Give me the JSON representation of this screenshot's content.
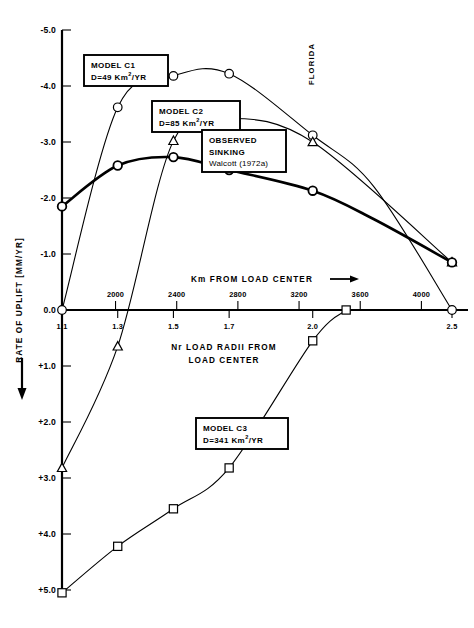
{
  "figure": {
    "florida_label": "FLORIDA",
    "y_axis": {
      "title_prefix_arrow": "↓",
      "title": "RATE OF UPLIFT  [MM/YR]",
      "ticks": [
        "-5.0",
        "-4.0",
        "-3.0",
        "-2.0",
        "-1.0",
        "0.0",
        "+1.0",
        "+2.0",
        "+3.0",
        "+4.0",
        "+5.0"
      ],
      "tick_values": [
        -5.0,
        -4.0,
        -3.0,
        -2.0,
        -1.0,
        0.0,
        1.0,
        2.0,
        3.0,
        4.0,
        5.0
      ]
    },
    "x_axis": {
      "top_title": "Km  FROM  LOAD  CENTER",
      "top_title_arrow": "⟶",
      "bottom_title_line1": "Nr  LOAD  RADII  FROM",
      "bottom_title_line2": "LOAD  CENTER",
      "km_ticks": [
        "2000",
        "2400",
        "2800",
        "3200",
        "3600",
        "4000"
      ],
      "km_tick_values": [
        2000,
        2400,
        2800,
        3200,
        3600,
        4000
      ],
      "nr_ticks": [
        "1.1",
        "1.3",
        "1.5",
        "1.7",
        "2.0",
        "2.5"
      ],
      "nr_tick_values": [
        1.1,
        1.3,
        1.5,
        1.7,
        2.0,
        2.5
      ]
    },
    "annotations": [
      {
        "id": "c1",
        "line1": "MODEL  C1",
        "line2_pre": "D=49  Km",
        "line2_sup": "2",
        "line2_post": "/YR"
      },
      {
        "id": "c2",
        "line1": "MODEL  C2",
        "line2_pre": "D=85  Km",
        "line2_sup": "2",
        "line2_post": "/YR"
      },
      {
        "id": "observed",
        "line1": "OBSERVED",
        "line2": "SINKING",
        "line3": "Walcott  (1972a)"
      },
      {
        "id": "c3",
        "line1": "MODEL  C3",
        "line2_pre": "D=341  Km",
        "line2_sup": "2",
        "line2_post": "/YR"
      }
    ]
  },
  "chart_data": {
    "type": "line",
    "title": "",
    "xlabel": "Nr LOAD RADII FROM LOAD CENTER",
    "ylabel": "RATE OF UPLIFT [MM/YR]",
    "xlim": [
      1.1,
      2.5
    ],
    "ylim": [
      5.0,
      -5.0
    ],
    "y_axis_inverted": true,
    "grid": false,
    "legend": "inline-annotation-boxes",
    "x_secondary_axis": {
      "label": "Km FROM LOAD CENTER",
      "lim": [
        1600,
        4200
      ]
    },
    "series": [
      {
        "name": "MODEL C1",
        "detail": "D=49 Km2/YR",
        "marker": "circle",
        "x": [
          1.1,
          1.3,
          1.5,
          1.7,
          2.0,
          2.22,
          2.5
        ],
        "y": [
          0.0,
          -3.62,
          -4.18,
          -4.22,
          -3.12,
          -2.2,
          0.0
        ]
      },
      {
        "name": "MODEL C2",
        "detail": "D=85 Km2/YR",
        "marker": "triangle",
        "x": [
          1.1,
          1.3,
          1.5,
          1.7,
          2.0,
          2.5
        ],
        "y": [
          2.82,
          0.65,
          -3.02,
          -3.42,
          -3.0,
          -0.85
        ]
      },
      {
        "name": "OBSERVED SINKING",
        "detail": "Walcott (1972a)",
        "marker": "circle",
        "line_weight": "thick",
        "x": [
          1.1,
          1.3,
          1.5,
          1.7,
          2.0,
          2.22,
          2.5
        ],
        "y": [
          -1.85,
          -2.58,
          -2.73,
          -2.5,
          -2.13,
          -1.62,
          -0.85
        ]
      },
      {
        "name": "MODEL C3",
        "detail": "D=341 Km2/YR",
        "marker": "square",
        "x": [
          1.1,
          1.3,
          1.5,
          1.7,
          2.0,
          2.12
        ],
        "y": [
          5.05,
          4.22,
          3.55,
          2.82,
          0.55,
          0.0
        ]
      }
    ]
  }
}
